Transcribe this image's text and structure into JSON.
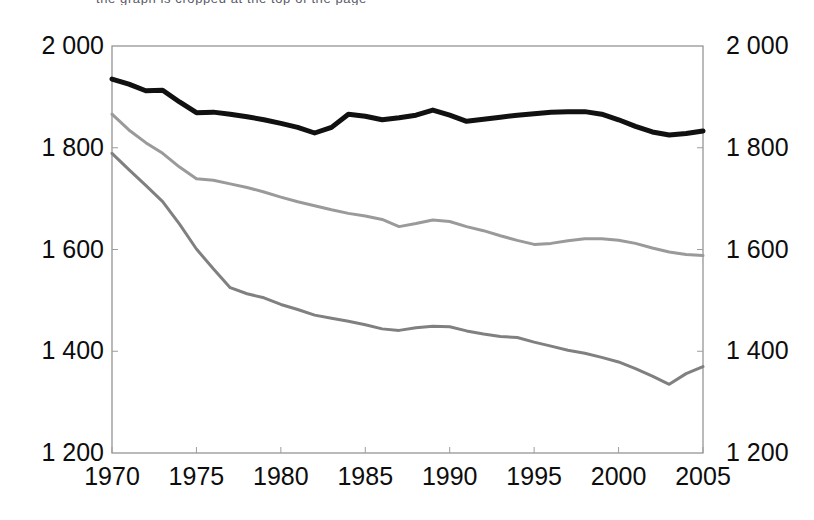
{
  "top_clipped_caption": "the graph is cropped at the top of the page",
  "chart_data": {
    "type": "line",
    "title": "",
    "subtitle": "",
    "xlabel": "",
    "ylabel": "",
    "xlim": [
      1970,
      2005
    ],
    "ylim": [
      1200,
      2000
    ],
    "grid": false,
    "legend": "none",
    "dual_y_axis": true,
    "x_tick_labels": [
      "1970",
      "1975",
      "1980",
      "1985",
      "1990",
      "1995",
      "2000",
      "2005"
    ],
    "x_ticks": [
      1970,
      1975,
      1980,
      1985,
      1990,
      1995,
      2000,
      2005
    ],
    "y_tick_labels_left": [
      "2 000",
      "1 800",
      "1 600",
      "1 400",
      "1 200"
    ],
    "y_tick_labels_right": [
      "2 000",
      "1 800",
      "1 600",
      "1 400",
      "1 200"
    ],
    "y_ticks": [
      2000,
      1800,
      1600,
      1400,
      1200
    ],
    "x": [
      1970,
      1971,
      1972,
      1973,
      1974,
      1975,
      1976,
      1977,
      1978,
      1979,
      1980,
      1981,
      1982,
      1983,
      1984,
      1985,
      1986,
      1987,
      1988,
      1989,
      1990,
      1991,
      1992,
      1993,
      1994,
      1995,
      1996,
      1997,
      1998,
      1999,
      2000,
      2001,
      2002,
      2003,
      2004,
      2005
    ],
    "series": [
      {
        "name": "series-black",
        "color": "#111111",
        "width": 5.0,
        "values": [
          1935,
          1925,
          1912,
          1913,
          1890,
          1869,
          1870,
          1866,
          1861,
          1855,
          1848,
          1840,
          1829,
          1840,
          1866,
          1862,
          1855,
          1859,
          1864,
          1874,
          1864,
          1852,
          1856,
          1860,
          1864,
          1867,
          1870,
          1871,
          1871,
          1866,
          1855,
          1842,
          1831,
          1825,
          1828,
          1833
        ]
      },
      {
        "name": "series-light-gray",
        "color": "#9a9a9a",
        "width": 3.0,
        "values": [
          1866,
          1835,
          1810,
          1789,
          1762,
          1739,
          1736,
          1729,
          1722,
          1713,
          1703,
          1694,
          1686,
          1678,
          1671,
          1666,
          1659,
          1645,
          1651,
          1658,
          1655,
          1645,
          1637,
          1627,
          1618,
          1610,
          1612,
          1617,
          1621,
          1621,
          1618,
          1612,
          1603,
          1595,
          1590,
          1588
        ]
      },
      {
        "name": "series-dark-gray",
        "color": "#808080",
        "width": 3.0,
        "values": [
          1789,
          1757,
          1726,
          1694,
          1650,
          1601,
          1562,
          1525,
          1513,
          1505,
          1492,
          1482,
          1471,
          1465,
          1459,
          1452,
          1444,
          1441,
          1446,
          1449,
          1448,
          1440,
          1434,
          1429,
          1427,
          1418,
          1410,
          1402,
          1396,
          1388,
          1379,
          1366,
          1351,
          1335,
          1356,
          1370
        ]
      }
    ]
  },
  "plot_geometry": {
    "left": 112,
    "right": 703,
    "top": 46,
    "bottom": 453
  }
}
